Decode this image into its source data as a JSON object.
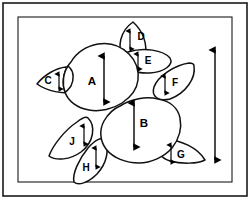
{
  "figure": {
    "background_color": "#ffffff",
    "line_color": "#111111",
    "frame": {
      "style": "double-rule rectangular border",
      "outer_inset_px": 3,
      "inner_inset_px": 18
    },
    "scale_bar": {
      "name": "scale-bar",
      "orientation": "vertical",
      "arrowheads": "double",
      "label": "",
      "x_px": 215,
      "y_top_px": 48,
      "y_bottom_px": 162
    }
  },
  "regions": [
    {
      "id": "A",
      "label": "A",
      "kind": "main-lobe",
      "label_x": 92,
      "label_y": 82,
      "arrow": {
        "x": 104,
        "y_top": 53,
        "y_bottom": 104,
        "heads": "double"
      }
    },
    {
      "id": "B",
      "label": "B",
      "kind": "main-lobe",
      "label_x": 144,
      "label_y": 124,
      "arrow": {
        "x": 134,
        "y_top": 100,
        "y_bottom": 149,
        "heads": "double"
      }
    },
    {
      "id": "C",
      "label": "C",
      "kind": "side-lobe",
      "label_x": 48,
      "label_y": 81,
      "arrow": {
        "x": 59,
        "y_top": 72,
        "y_bottom": 90,
        "heads": "double"
      }
    },
    {
      "id": "D",
      "label": "D",
      "kind": "side-lobe",
      "label_x": 141,
      "label_y": 37,
      "arrow": {
        "x": 130,
        "y_top": 29,
        "y_bottom": 50,
        "heads": "double"
      }
    },
    {
      "id": "E",
      "label": "E",
      "kind": "side-lobe",
      "label_x": 148,
      "label_y": 61,
      "arrow": {
        "x": 138,
        "y_top": 52,
        "y_bottom": 70,
        "heads": "double"
      }
    },
    {
      "id": "F",
      "label": "F",
      "kind": "side-lobe",
      "label_x": 175,
      "label_y": 83,
      "arrow": {
        "x": 165,
        "y_top": 74,
        "y_bottom": 94,
        "heads": "double"
      }
    },
    {
      "id": "G",
      "label": "G",
      "kind": "side-lobe",
      "label_x": 181,
      "label_y": 155,
      "arrow": {
        "x": 171,
        "y_top": 143,
        "y_bottom": 163,
        "heads": "double"
      }
    },
    {
      "id": "H",
      "label": "H",
      "kind": "side-lobe",
      "label_x": 86,
      "label_y": 168,
      "arrow": {
        "x": 96,
        "y_top": 146,
        "y_bottom": 168,
        "heads": "double"
      }
    },
    {
      "id": "J",
      "label": "J",
      "kind": "side-lobe",
      "label_x": 72,
      "label_y": 142,
      "arrow": {
        "x": 84,
        "y_top": 124,
        "y_bottom": 145,
        "heads": "double"
      }
    }
  ]
}
